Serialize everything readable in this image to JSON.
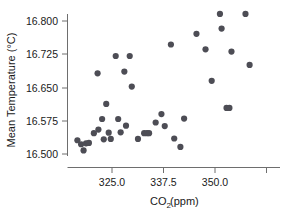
{
  "chart_data": {
    "type": "scatter",
    "title": "",
    "xlabel": "CO2 (ppm)",
    "xlabel_parts": {
      "main": "CO",
      "sub": "2",
      "unit": " (ppm)"
    },
    "ylabel": "Mean Temperature (°C)",
    "ylabel_parts": {
      "main": "Mean Temperature (",
      "sup": "°",
      "unit": "C)"
    },
    "xlim": [
      315.5,
      362.5
    ],
    "ylim": [
      16.487,
      16.826
    ],
    "grid": false,
    "legend": null,
    "xticks": [
      325.0,
      337.5,
      350.0,
      362.5
    ],
    "xtick_labels": [
      "325.0",
      "337.5",
      "350.0",
      ""
    ],
    "yticks": [
      16.5,
      16.575,
      16.65,
      16.725,
      16.8
    ],
    "ytick_labels": [
      "16.500",
      "16.575",
      "16.650",
      "16.725",
      "16.800"
    ],
    "marker": {
      "shape": "circle",
      "size": 3.1,
      "color": "#4d4d55"
    },
    "series": [
      {
        "name": "Annual mean temperature vs CO2",
        "points": [
          {
            "x": 316.6,
            "y": 16.531
          },
          {
            "x": 317.5,
            "y": 16.522
          },
          {
            "x": 318.1,
            "y": 16.508
          },
          {
            "x": 318.7,
            "y": 16.524
          },
          {
            "x": 319.4,
            "y": 16.525
          },
          {
            "x": 320.6,
            "y": 16.547
          },
          {
            "x": 321.5,
            "y": 16.682
          },
          {
            "x": 321.7,
            "y": 16.555
          },
          {
            "x": 322.6,
            "y": 16.579
          },
          {
            "x": 323.0,
            "y": 16.533
          },
          {
            "x": 323.6,
            "y": 16.613
          },
          {
            "x": 324.2,
            "y": 16.548
          },
          {
            "x": 324.7,
            "y": 16.534
          },
          {
            "x": 325.9,
            "y": 16.721
          },
          {
            "x": 326.5,
            "y": 16.579
          },
          {
            "x": 327.1,
            "y": 16.549
          },
          {
            "x": 328.0,
            "y": 16.686
          },
          {
            "x": 328.4,
            "y": 16.564
          },
          {
            "x": 329.3,
            "y": 16.721
          },
          {
            "x": 329.8,
            "y": 16.652
          },
          {
            "x": 331.3,
            "y": 16.534
          },
          {
            "x": 332.8,
            "y": 16.547
          },
          {
            "x": 333.5,
            "y": 16.547
          },
          {
            "x": 334.0,
            "y": 16.547
          },
          {
            "x": 335.6,
            "y": 16.571
          },
          {
            "x": 337.0,
            "y": 16.59
          },
          {
            "x": 337.8,
            "y": 16.563
          },
          {
            "x": 339.3,
            "y": 16.747
          },
          {
            "x": 340.1,
            "y": 16.535
          },
          {
            "x": 341.6,
            "y": 16.516
          },
          {
            "x": 342.5,
            "y": 16.58
          },
          {
            "x": 345.5,
            "y": 16.771
          },
          {
            "x": 347.7,
            "y": 16.736
          },
          {
            "x": 349.2,
            "y": 16.665
          },
          {
            "x": 351.2,
            "y": 16.816
          },
          {
            "x": 351.6,
            "y": 16.783
          },
          {
            "x": 352.8,
            "y": 16.604
          },
          {
            "x": 353.5,
            "y": 16.604
          },
          {
            "x": 354.0,
            "y": 16.731
          },
          {
            "x": 357.4,
            "y": 16.816
          },
          {
            "x": 358.4,
            "y": 16.701
          }
        ]
      }
    ]
  },
  "axes": {
    "x_axis_name": "co2-axis",
    "y_axis_name": "temperature-axis"
  }
}
